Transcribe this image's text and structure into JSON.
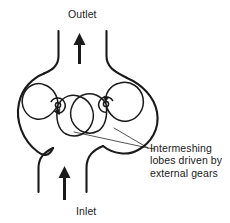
{
  "figure": {
    "background_color": "#ffffff",
    "line_color": "#1a1a1a",
    "width": 230,
    "height": 223
  },
  "labels": {
    "outlet": "Outlet",
    "inlet": "Inlet"
  },
  "callout": {
    "lines": [
      "Intermeshing",
      "lobes driven by",
      "external gears"
    ]
  },
  "flow_arrows": [
    {
      "name": "outlet-arrow",
      "direction": "up",
      "position": "top-center"
    },
    {
      "name": "inlet-arrow",
      "direction": "up",
      "position": "bottom-center"
    }
  ],
  "rotors": [
    {
      "name": "left-rotor",
      "rotation": "clockwise",
      "center_x": 58,
      "center_y": 105
    },
    {
      "name": "right-rotor",
      "rotation": "counter-clockwise",
      "center_x": 106,
      "center_y": 104
    }
  ],
  "housing": {
    "name": "pump-housing",
    "left": 17,
    "right": 162,
    "top": 50,
    "bottom": 168
  }
}
